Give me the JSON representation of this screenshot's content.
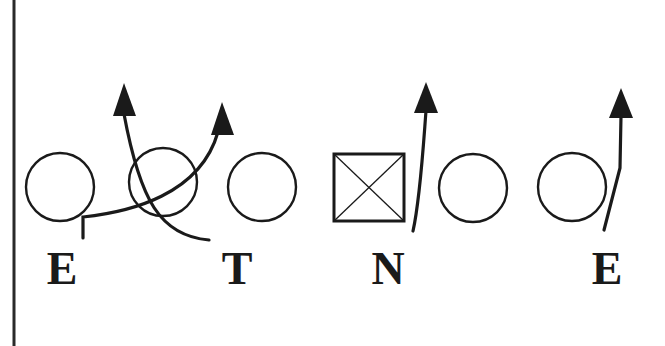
{
  "diagram": {
    "title": "",
    "colors": {
      "background": "#ffffff",
      "ink": "#1a1a1a"
    },
    "sideline": {
      "x": 14
    },
    "players": [
      {
        "id": "left-end-circle",
        "shape": "circle",
        "cx": 60,
        "cy": 187
      },
      {
        "id": "left-guard-circle",
        "shape": "circle",
        "cx": 163,
        "cy": 182
      },
      {
        "id": "left-tackle-circle",
        "shape": "circle",
        "cx": 262,
        "cy": 187
      },
      {
        "id": "center-square",
        "shape": "square-x",
        "x": 333,
        "y": 153,
        "w": 71,
        "h": 68
      },
      {
        "id": "right-guard-circle",
        "shape": "circle",
        "cx": 473,
        "cy": 188
      },
      {
        "id": "right-tackle-circle",
        "shape": "circle",
        "cx": 572,
        "cy": 187
      }
    ],
    "labels": [
      {
        "id": "label-e-left",
        "text": "E",
        "x": 62,
        "y": 284
      },
      {
        "id": "label-t",
        "text": "T",
        "x": 237,
        "y": 284
      },
      {
        "id": "label-n",
        "text": "N",
        "x": 388,
        "y": 284
      },
      {
        "id": "label-e-right",
        "text": "E",
        "x": 607,
        "y": 284
      }
    ],
    "routes": [
      {
        "id": "route-e-left",
        "from": "E",
        "description": "end loops inside toward upper right"
      },
      {
        "id": "route-t",
        "from": "T",
        "description": "tackle loops inside toward upper left"
      },
      {
        "id": "route-n",
        "from": "N",
        "description": "nose rushes straight upfield"
      },
      {
        "id": "route-e-right",
        "from": "E",
        "description": "end rushes straight upfield"
      }
    ]
  }
}
